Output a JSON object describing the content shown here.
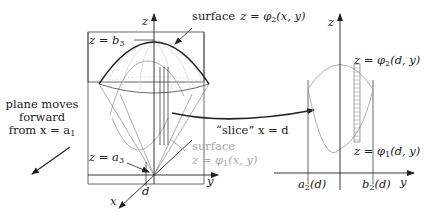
{
  "figure": {
    "left_panel": {
      "axis_labels": {
        "z": "z",
        "y": "y",
        "x": "x"
      },
      "top_label": {
        "lhs": "z = b",
        "sub": "3"
      },
      "bottom_label": {
        "lhs": "z = a",
        "sub": "3"
      },
      "d_label": "d",
      "upper_surface_label": {
        "word": "surface",
        "eq": "z = φ",
        "sub": "2",
        "args": "(x, y)"
      },
      "lower_surface_label": {
        "word": "surface",
        "eq": "z = φ",
        "sub": "1",
        "args": "(x, y)"
      },
      "plane_text": {
        "line1": "plane moves",
        "line2": "forward",
        "line3": "from x = a",
        "sub": "1"
      }
    },
    "slice_label": "“slice”  x = d",
    "right_panel": {
      "axis_labels": {
        "z": "z",
        "y": "y"
      },
      "top_label": {
        "eq": "z = φ",
        "sub": "2",
        "args": "(d, y)"
      },
      "bottom_label": {
        "eq": "z = φ",
        "sub": "1",
        "args": "(d, y)"
      },
      "a_label": {
        "base": "a",
        "sub": "2",
        "args": "(d)"
      },
      "b_label": {
        "base": "b",
        "sub": "2",
        "args": "(d)"
      }
    },
    "colors": {
      "ink": "#222222",
      "gray": "#a8a8a8",
      "light": "#cfcfcf"
    }
  }
}
